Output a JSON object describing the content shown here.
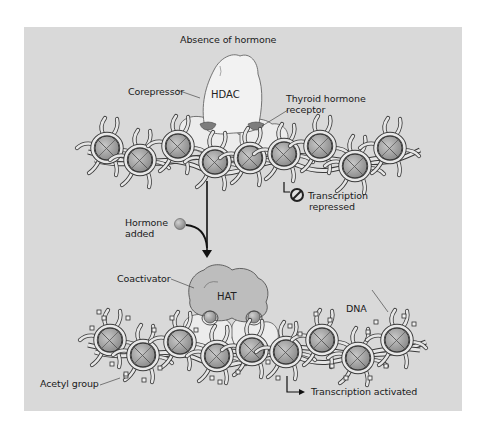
{
  "figure": {
    "title": "Absence of hormone",
    "top_state": {
      "labels": {
        "corepressor": "Corepressor",
        "hdac": "HDAC",
        "receptor_line1": "Thyroid hormone",
        "receptor_line2": "receptor",
        "repressed_line1": "Transcription",
        "repressed_line2": "repressed"
      },
      "icons": [
        "no-symbol-icon"
      ]
    },
    "transition": {
      "hormone_line1": "Hormone",
      "hormone_line2": "added",
      "icons": [
        "hormone-sphere-icon",
        "down-arrow-icon"
      ]
    },
    "bottom_state": {
      "labels": {
        "coactivator": "Coactivator",
        "hat": "HAT",
        "dna": "DNA",
        "acetyl": "Acetyl group",
        "activated": "Transcription activated"
      },
      "icons": [
        "right-arrow-icon"
      ]
    },
    "colors": {
      "page_background": "#ffffff",
      "panel_background": "#d9d9d9",
      "hdac_fill": "#f2f2f2",
      "coactivator_fill": "#bdbdbd",
      "receptor_fill": "#ececec",
      "nucleosome_core": "#a8a8a8",
      "dna_strand": "#e6e6e6",
      "outline": "#3a3a3a",
      "arrow": "#111111"
    }
  }
}
